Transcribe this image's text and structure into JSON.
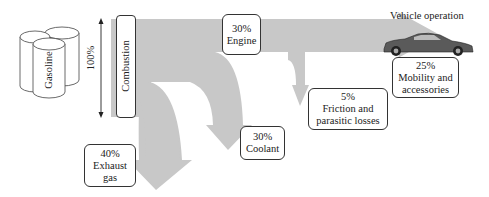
{
  "diagram": {
    "source": {
      "label": "Gasoline",
      "icon": "fuel-cylinders-icon"
    },
    "total": {
      "label": "100%"
    },
    "combustion": {
      "label": "Combustion"
    },
    "flows": [
      {
        "id": "engine",
        "percent": "30%",
        "label": "Engine"
      },
      {
        "id": "exhaust",
        "percent": "40%",
        "label_line1": "Exhaust",
        "label_line2": "gas"
      },
      {
        "id": "coolant",
        "percent": "30%",
        "label": "Coolant"
      },
      {
        "id": "friction",
        "percent": "5%",
        "label_line1": "Friction and",
        "label_line2": "parasitic losses"
      },
      {
        "id": "mobility",
        "percent": "25%",
        "label_line1": "Mobility and",
        "label_line2": "accessories"
      }
    ],
    "destination": {
      "label": "Vehicle operation",
      "icon": "sports-car-icon"
    },
    "colors": {
      "flow": "#c8c8c8",
      "outline": "#333333",
      "car": "#555555"
    }
  }
}
